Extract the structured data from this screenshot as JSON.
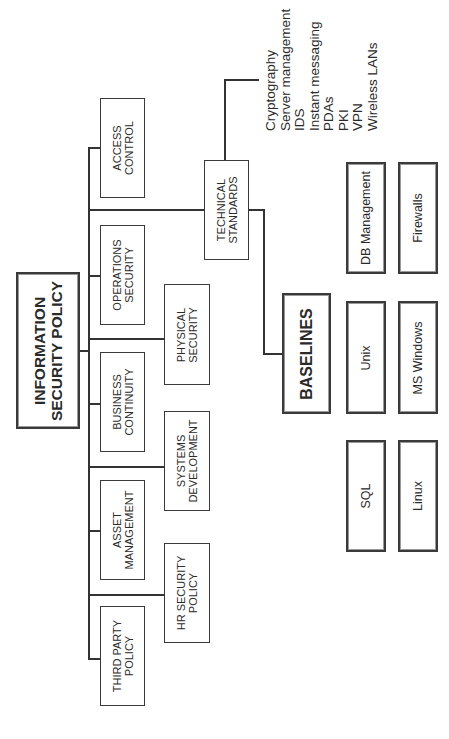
{
  "diagram": {
    "root": {
      "label_line1": "INFORMATION",
      "label_line2": "SECURITY POLICY"
    },
    "level1": [
      {
        "id": "access-control",
        "line1": "ACCESS",
        "line2": "CONTROL"
      },
      {
        "id": "operations-security",
        "line1": "OPERATIONS",
        "line2": "SECURITY"
      },
      {
        "id": "business-continuity",
        "line1": "BUSINESS",
        "line2": "CONTINUITY"
      },
      {
        "id": "asset-management",
        "line1": "ASSET",
        "line2": "MANAGEMENT"
      },
      {
        "id": "third-party-policy",
        "line1": "THIRD PARTY",
        "line2": "POLICY"
      }
    ],
    "level2": [
      {
        "id": "technical-standards",
        "line1": "TECHNICAL",
        "line2": "STANDARDS"
      },
      {
        "id": "physical-security",
        "line1": "PHYSICAL",
        "line2": "SECURITY"
      },
      {
        "id": "systems-development",
        "line1": "SYSTEMS",
        "line2": "DEVELOPMENT"
      },
      {
        "id": "hr-security-policy",
        "line1": "HR SECURITY",
        "line2": "POLICY"
      }
    ],
    "technical_standards_list": [
      "Cryptography",
      "Server management",
      "IDS",
      "Instant messaging",
      "PDAs",
      "PKI",
      "VPN",
      "Wireless LANs"
    ],
    "baselines": {
      "label": "BASELINES",
      "items": [
        "DB Management",
        "Firewalls",
        "Unix",
        "MS Windows",
        "SQL",
        "Linux"
      ]
    }
  }
}
